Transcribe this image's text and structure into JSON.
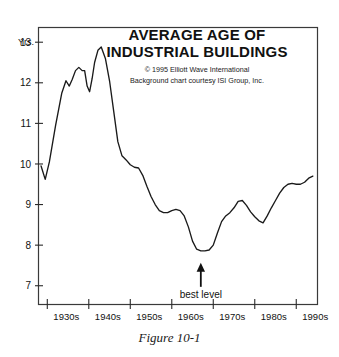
{
  "figure": {
    "caption": "Figure 10-1"
  },
  "chart_data": {
    "type": "line",
    "title_line1": "AVERAGE AGE OF",
    "title_line2": "INDUSTRIAL BUILDINGS",
    "credit_line1": "© 1995 Elliott Wave International",
    "credit_line2": "Background chart courtesy ISI Group, Inc.",
    "ylabel": "Yrs.",
    "xlabel": "",
    "ylim": [
      6.55,
      13.35
    ],
    "xlim": [
      1928,
      1995
    ],
    "yticks": [
      7,
      8,
      9,
      10,
      11,
      12,
      13
    ],
    "ytick_labels": [
      "7",
      "8",
      "9",
      "10",
      "11",
      "12",
      "13"
    ],
    "xticks": [
      1930,
      1940,
      1950,
      1960,
      1970,
      1980,
      1990
    ],
    "xtick_labels": [
      "1930s",
      "1940s",
      "1950s",
      "1960s",
      "1970s",
      "1980s",
      "1990s"
    ],
    "grid": false,
    "legend": false,
    "line_color": "#1a1a1a",
    "series": [
      {
        "name": "Average age of industrial buildings",
        "x": [
          1928.5,
          1929.5,
          1930.5,
          1932.0,
          1933.5,
          1934.5,
          1935.3,
          1936.0,
          1936.8,
          1937.6,
          1938.4,
          1939.0,
          1939.6,
          1940.2,
          1940.8,
          1941.4,
          1942.2,
          1943.0,
          1944.0,
          1945.0,
          1946.0,
          1947.0,
          1948.0,
          1949.0,
          1950.0,
          1951.0,
          1952.0,
          1953.0,
          1954.0,
          1955.0,
          1956.0,
          1957.0,
          1958.0,
          1959.0,
          1960.0,
          1961.0,
          1962.0,
          1963.0,
          1964.0,
          1965.0,
          1966.0,
          1967.0,
          1968.0,
          1969.0,
          1970.0,
          1971.0,
          1972.0,
          1973.0,
          1974.0,
          1975.0,
          1976.0,
          1977.0,
          1978.0,
          1979.0,
          1980.0,
          1981.0,
          1982.0,
          1983.0,
          1984.0,
          1985.0,
          1986.0,
          1987.0,
          1988.0,
          1989.0,
          1990.0,
          1991.0,
          1992.0,
          1993.0,
          1994.0
        ],
        "y": [
          9.95,
          9.62,
          10.05,
          10.95,
          11.75,
          12.05,
          11.92,
          12.08,
          12.3,
          12.38,
          12.3,
          12.3,
          11.92,
          11.78,
          12.1,
          12.5,
          12.8,
          12.88,
          12.6,
          12.05,
          11.3,
          10.55,
          10.2,
          10.1,
          9.98,
          9.92,
          9.9,
          9.72,
          9.45,
          9.2,
          9.0,
          8.85,
          8.8,
          8.8,
          8.85,
          8.88,
          8.85,
          8.72,
          8.45,
          8.1,
          7.9,
          7.86,
          7.86,
          7.88,
          8.0,
          8.3,
          8.58,
          8.72,
          8.8,
          8.92,
          9.08,
          9.1,
          8.98,
          8.82,
          8.7,
          8.6,
          8.55,
          8.72,
          8.92,
          9.1,
          9.28,
          9.42,
          9.5,
          9.52,
          9.5,
          9.5,
          9.55,
          9.65,
          9.7
        ]
      }
    ],
    "annotations": [
      {
        "label": "best level",
        "type": "arrow-up",
        "target_x": 1967.0,
        "target_y": 7.86
      }
    ]
  }
}
